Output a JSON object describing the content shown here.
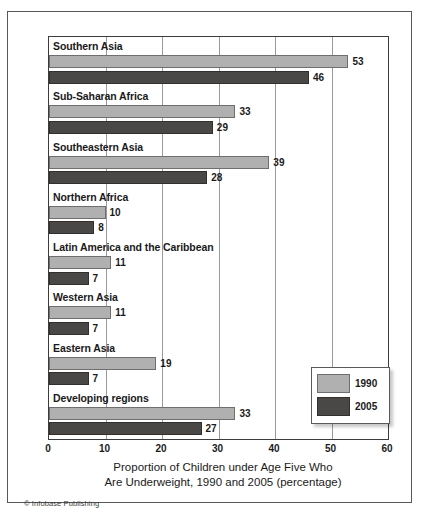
{
  "figure": {
    "credit": "© Infobase Publishing",
    "axis_title_line1": "Proportion of Children under Age Five Who",
    "axis_title_line2": "Are Underweight, 1990 and 2005 (percentage)"
  },
  "legend": {
    "position": "inside-bottom-right",
    "items": [
      {
        "label": "1990",
        "color": "#b0b0b0"
      },
      {
        "label": "2005",
        "color": "#4a4846"
      }
    ]
  },
  "chart_data": {
    "type": "bar",
    "orientation": "horizontal",
    "title": "Proportion of Children under Age Five Who Are Underweight, 1990 and 2005 (percentage)",
    "xlabel": "Proportion of Children under Age Five Who Are Underweight, 1990 and 2005 (percentage)",
    "ylabel": "",
    "xlim": [
      0,
      60
    ],
    "xticks": [
      0,
      10,
      20,
      30,
      40,
      50,
      60
    ],
    "grid": "vertical",
    "legend_position": "inside-bottom-right",
    "categories": [
      "Southern Asia",
      "Sub-Saharan Africa",
      "Southeastern Asia",
      "Northern Africa",
      "Latin America and the Caribbean",
      "Western Asia",
      "Eastern Asia",
      "Developing regions"
    ],
    "series": [
      {
        "name": "1990",
        "color": "#b0b0b0",
        "values": [
          53,
          33,
          39,
          10,
          11,
          11,
          19,
          33
        ]
      },
      {
        "name": "2005",
        "color": "#4a4846",
        "values": [
          46,
          29,
          28,
          8,
          7,
          7,
          7,
          27
        ]
      }
    ]
  }
}
